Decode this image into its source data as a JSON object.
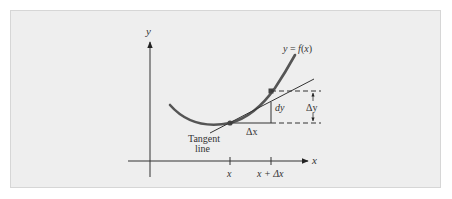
{
  "figure": {
    "type": "tangent-line-differential-diagram",
    "background_color": "#eeeeee",
    "curve_color": "#555555",
    "line_color": "#333333"
  },
  "axes": {
    "y_label": "y",
    "x_label": "x"
  },
  "labels": {
    "curve": "y = f(x)",
    "tangent_line_1": "Tangent",
    "tangent_line_2": "line",
    "dy": "dy",
    "delta_y": "Δy",
    "delta_x": "Δx",
    "tick_x": "x",
    "tick_x_plus_dx": "x + Δx"
  }
}
